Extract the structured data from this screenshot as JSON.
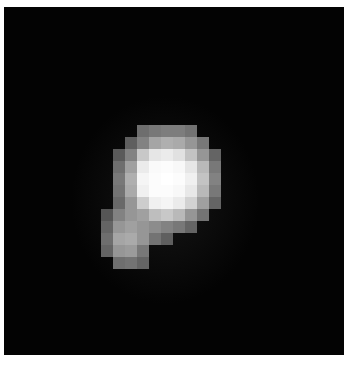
{
  "image": {
    "description": "Low-resolution grayscale pixelated image of a bright blob on a black background",
    "background_color": "#030303",
    "border_color": "#ffffff",
    "grid": {
      "origin_x": 101,
      "origin_y": 125,
      "cell_size": 12,
      "rows": [
        [
          0,
          0,
          0,
          0,
          0,
          0,
          0,
          0,
          0,
          0,
          0,
          0,
          0,
          0,
          0,
          0
        ],
        [
          0,
          0,
          0,
          0,
          0,
          0,
          0,
          0,
          0,
          0,
          0,
          0,
          0,
          0,
          0,
          0
        ],
        [
          0,
          0,
          0,
          0,
          0,
          0,
          0,
          0,
          0,
          0,
          0,
          0,
          0,
          0,
          0,
          0
        ],
        [
          0,
          0,
          0,
          0,
          0,
          0,
          0,
          0,
          0,
          0,
          0,
          0,
          0,
          0,
          0,
          0
        ],
        [
          0,
          0,
          0,
          0,
          0,
          0,
          0,
          0,
          0,
          0,
          0,
          0,
          0,
          0,
          0,
          0
        ],
        [
          0,
          0,
          0,
          0,
          0,
          0,
          0,
          0,
          0,
          0,
          0,
          0,
          0,
          0,
          0,
          0
        ],
        [
          0,
          0,
          0,
          0,
          0,
          0,
          0,
          0,
          0,
          0,
          0,
          0,
          0,
          0,
          0,
          0
        ],
        [
          0,
          0,
          0,
          0,
          0,
          0,
          0,
          0,
          0,
          0,
          0,
          0,
          0,
          0,
          0,
          0
        ],
        [
          0,
          0,
          0,
          0,
          0,
          0,
          0,
          0,
          0,
          0,
          0,
          0,
          0,
          0,
          0,
          0
        ],
        [
          0,
          0,
          0,
          0,
          0,
          0,
          0,
          0,
          0,
          0,
          0,
          0,
          0,
          0,
          0,
          0
        ],
        [
          0,
          0,
          0,
          0,
          0,
          0,
          0,
          0,
          0,
          0,
          0,
          0,
          0,
          0,
          0,
          0
        ],
        [
          0,
          0,
          0,
          0,
          0,
          0,
          0,
          0,
          0,
          0,
          0,
          0,
          0,
          0,
          0,
          0
        ]
      ],
      "cells": [
        [
          0,
          0,
          0,
          0,
          0,
          0,
          0,
          0,
          0,
          0,
          0,
          0,
          0
        ],
        [
          0,
          0,
          0,
          110,
          120,
          125,
          125,
          115,
          0,
          0,
          0,
          0,
          0
        ],
        [
          0,
          0,
          95,
          130,
          165,
          175,
          170,
          150,
          120,
          0,
          0,
          0,
          0
        ],
        [
          0,
          90,
          130,
          200,
          230,
          235,
          225,
          195,
          150,
          100,
          0,
          0,
          0
        ],
        [
          0,
          110,
          160,
          235,
          250,
          252,
          248,
          230,
          185,
          120,
          0,
          0,
          0
        ],
        [
          0,
          120,
          175,
          245,
          252,
          255,
          252,
          240,
          195,
          130,
          0,
          0,
          0
        ],
        [
          0,
          115,
          170,
          240,
          252,
          252,
          248,
          232,
          185,
          120,
          0,
          0,
          0
        ],
        [
          0,
          105,
          150,
          205,
          240,
          245,
          235,
          210,
          160,
          100,
          0,
          0,
          0
        ],
        [
          85,
          130,
          150,
          160,
          190,
          200,
          185,
          150,
          115,
          0,
          0,
          0,
          0
        ],
        [
          100,
          150,
          160,
          150,
          140,
          130,
          120,
          100,
          0,
          0,
          0,
          0,
          0
        ],
        [
          110,
          165,
          170,
          150,
          115,
          95,
          0,
          0,
          0,
          0,
          0,
          0,
          0
        ],
        [
          100,
          150,
          155,
          120,
          0,
          0,
          0,
          0,
          0,
          0,
          0,
          0,
          0
        ],
        [
          0,
          110,
          115,
          100,
          0,
          0,
          0,
          0,
          0,
          0,
          0,
          0,
          0
        ]
      ]
    }
  }
}
